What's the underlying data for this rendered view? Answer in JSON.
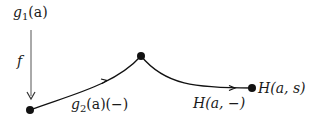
{
  "diagram": {
    "labels": {
      "top_source": {
        "base": "g",
        "sub": "1",
        "arg": "(a)"
      },
      "vertical_arrow": "f",
      "first_path": {
        "base": "g",
        "sub": "2",
        "arg": "(a)(−)"
      },
      "second_path": "H(a, −)",
      "endpoint": "H(a, s)"
    },
    "nodes": [
      {
        "id": "start",
        "x": 30,
        "y": 110
      },
      {
        "id": "peak",
        "x": 141,
        "y": 56
      },
      {
        "id": "end",
        "x": 252,
        "y": 88
      }
    ],
    "edges": [
      {
        "id": "f",
        "from": [
          31,
          30
        ],
        "to": [
          31,
          99
        ],
        "style": "arrow"
      },
      {
        "id": "g2",
        "from": "start",
        "to": "peak",
        "style": "curve-with-mid-arrow"
      },
      {
        "id": "H",
        "from": "peak",
        "to": "end",
        "style": "curve-with-mid-arrow"
      }
    ],
    "colors": {
      "ink": "#111111",
      "arrow_gray": "#555555",
      "background": "#ffffff"
    }
  }
}
